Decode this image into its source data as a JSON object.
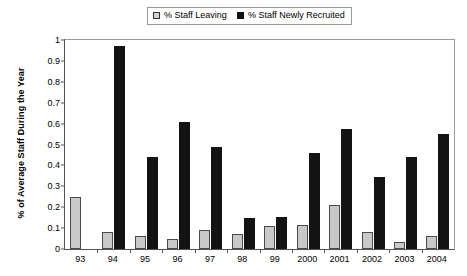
{
  "legend": {
    "entries": [
      {
        "label": "% Staff Leaving",
        "swatch": "leaving",
        "color": "#d2d2d2"
      },
      {
        "label": "% Staff Newly Recruited",
        "swatch": "recruited",
        "color": "#111111"
      }
    ]
  },
  "chart_data": {
    "type": "bar",
    "title": "",
    "xlabel": "",
    "ylabel": "% of Average Staff During the Year",
    "ylim": [
      0,
      1
    ],
    "yticks": [
      0,
      0.1,
      0.2,
      0.3,
      0.4,
      0.5,
      0.6,
      0.7,
      0.8,
      0.9,
      1
    ],
    "ytick_labels": [
      "0",
      "0.1",
      "0.2",
      "0.3",
      "0.4",
      "0.5",
      "0.6",
      "0.7",
      "0.8",
      "0.9",
      "1"
    ],
    "grid": false,
    "legend_position": "top-center",
    "categories": [
      "93",
      "94",
      "95",
      "96",
      "97",
      "98",
      "99",
      "2000",
      "2001",
      "2002",
      "2003",
      "2004"
    ],
    "series": [
      {
        "name": "% Staff Leaving",
        "color": "#c9c9c9",
        "values": [
          0.25,
          0.08,
          0.06,
          0.05,
          0.09,
          0.07,
          0.11,
          0.115,
          0.21,
          0.08,
          0.035,
          0.06
        ]
      },
      {
        "name": "% Staff Newly Recruited",
        "color": "#131313",
        "values": [
          null,
          0.97,
          0.44,
          0.61,
          0.49,
          0.15,
          0.155,
          0.46,
          0.575,
          0.345,
          0.44,
          0.55
        ]
      }
    ]
  }
}
